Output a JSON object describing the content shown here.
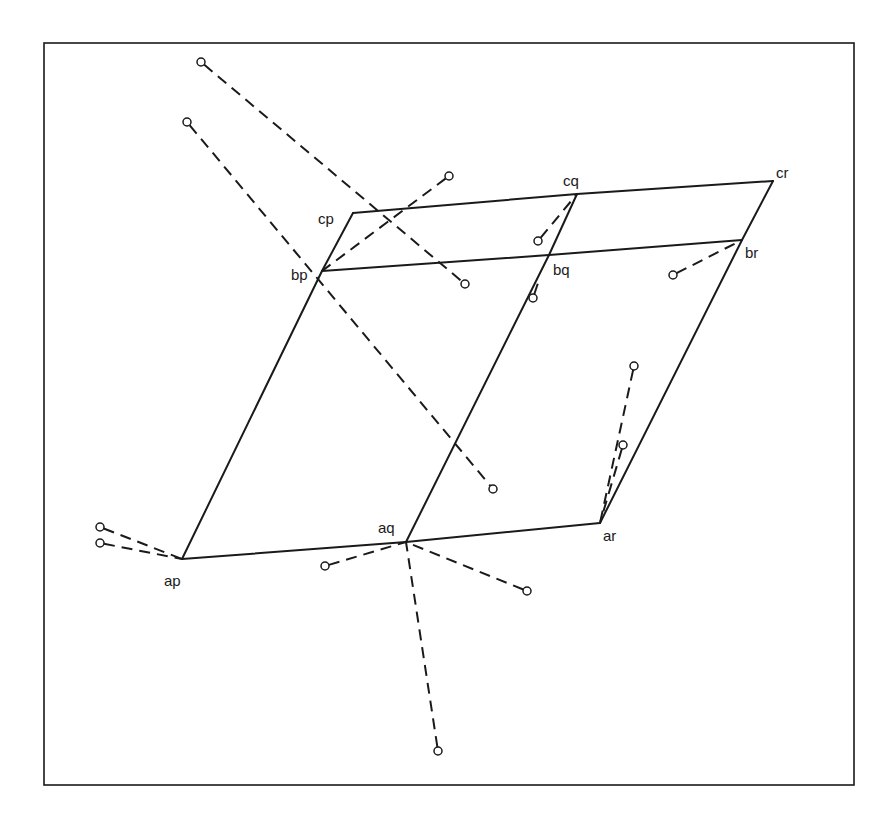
{
  "diagram": {
    "frame": {
      "x": 44,
      "y": 43,
      "width": 810,
      "height": 742
    },
    "colors": {
      "line": "#1a1a1a",
      "background": "#ffffff"
    },
    "nodes": [
      {
        "id": "ap",
        "label": "ap",
        "x": 182,
        "y": 559,
        "lx": 164,
        "ly": 586
      },
      {
        "id": "aq",
        "label": "aq",
        "x": 406,
        "y": 542,
        "lx": 378,
        "ly": 533
      },
      {
        "id": "ar",
        "label": "ar",
        "x": 600,
        "y": 523,
        "lx": 603,
        "ly": 541
      },
      {
        "id": "bp",
        "label": "bp",
        "x": 322,
        "y": 271,
        "lx": 291,
        "ly": 280
      },
      {
        "id": "bq",
        "label": "bq",
        "x": 549,
        "y": 255,
        "lx": 553,
        "ly": 275
      },
      {
        "id": "br",
        "label": "br",
        "x": 742,
        "y": 240,
        "lx": 745,
        "ly": 258
      },
      {
        "id": "cp",
        "label": "cp",
        "x": 353,
        "y": 213,
        "lx": 318,
        "ly": 224
      },
      {
        "id": "cq",
        "label": "cq",
        "x": 577,
        "y": 194,
        "lx": 563,
        "ly": 186
      },
      {
        "id": "cr",
        "label": "cr",
        "x": 773,
        "y": 181,
        "lx": 776,
        "ly": 178
      }
    ],
    "solid_edges": [
      [
        "ap",
        "aq"
      ],
      [
        "aq",
        "ar"
      ],
      [
        "bp",
        "bq"
      ],
      [
        "bq",
        "br"
      ],
      [
        "cp",
        "cq"
      ],
      [
        "cq",
        "cr"
      ],
      [
        "ap",
        "bp"
      ],
      [
        "bp",
        "cp"
      ],
      [
        "aq",
        "bq"
      ],
      [
        "bq",
        "cq"
      ],
      [
        "ar",
        "br"
      ],
      [
        "br",
        "cr"
      ]
    ],
    "dashed_edges": [
      {
        "x1": 201,
        "y1": 62,
        "x2": 465,
        "y2": 284,
        "circle_start": true,
        "circle_end": true
      },
      {
        "x1": 187,
        "y1": 122,
        "x2": 493,
        "y2": 489,
        "circle_start": true,
        "circle_end": true
      },
      {
        "x1": 449,
        "y1": 176,
        "x2": 322,
        "y2": 271,
        "circle_start": true,
        "circle_end": false
      },
      {
        "x1": 538,
        "y1": 241,
        "x2": 577,
        "y2": 194,
        "circle_start": true,
        "circle_end": false
      },
      {
        "x1": 533,
        "y1": 298,
        "x2": 539,
        "y2": 280,
        "circle_start": true,
        "circle_end": false
      },
      {
        "x1": 673,
        "y1": 275,
        "x2": 742,
        "y2": 240,
        "circle_start": true,
        "circle_end": false
      },
      {
        "x1": 634,
        "y1": 366,
        "x2": 600,
        "y2": 523,
        "circle_start": true,
        "circle_end": false
      },
      {
        "x1": 623,
        "y1": 445,
        "x2": 600,
        "y2": 523,
        "circle_start": true,
        "circle_end": false
      },
      {
        "x1": 100,
        "y1": 527,
        "x2": 182,
        "y2": 559,
        "circle_start": true,
        "circle_end": false
      },
      {
        "x1": 100,
        "y1": 543,
        "x2": 182,
        "y2": 559,
        "circle_start": true,
        "circle_end": false
      },
      {
        "x1": 325,
        "y1": 566,
        "x2": 406,
        "y2": 542,
        "circle_start": true,
        "circle_end": false
      },
      {
        "x1": 527,
        "y1": 591,
        "x2": 406,
        "y2": 542,
        "circle_start": true,
        "circle_end": false
      },
      {
        "x1": 438,
        "y1": 751,
        "x2": 406,
        "y2": 542,
        "circle_start": true,
        "circle_end": false
      }
    ]
  }
}
